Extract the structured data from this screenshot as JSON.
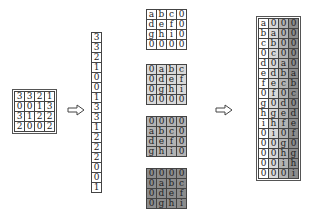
{
  "input_matrix": {
    "rows": [
      [
        "3",
        "3",
        "2",
        "1"
      ],
      [
        "0",
        "0",
        "1",
        "3"
      ],
      [
        "3",
        "1",
        "2",
        "2"
      ],
      [
        "2",
        "0",
        "0",
        "2"
      ]
    ]
  },
  "vectorized_input": {
    "values": [
      "3",
      "3",
      "2",
      "1",
      "0",
      "0",
      "1",
      "3",
      "3",
      "1",
      "2",
      "2",
      "2",
      "0",
      "0",
      "1"
    ]
  },
  "kernel_shifts": [
    {
      "shade": "#ffffff",
      "rows": [
        [
          "a",
          "b",
          "c",
          "0"
        ],
        [
          "d",
          "e",
          "f",
          "0"
        ],
        [
          "g",
          "h",
          "i",
          "0"
        ],
        [
          "0",
          "0",
          "0",
          "0"
        ]
      ]
    },
    {
      "shade": "#d9d9d9",
      "rows": [
        [
          "0",
          "a",
          "b",
          "c"
        ],
        [
          "0",
          "d",
          "e",
          "f"
        ],
        [
          "0",
          "g",
          "h",
          "i"
        ],
        [
          "0",
          "0",
          "0",
          "0"
        ]
      ]
    },
    {
      "shade": "#b3b3b3",
      "rows": [
        [
          "0",
          "0",
          "0",
          "0"
        ],
        [
          "a",
          "b",
          "c",
          "0"
        ],
        [
          "d",
          "e",
          "f",
          "0"
        ],
        [
          "g",
          "h",
          "i",
          "0"
        ]
      ]
    },
    {
      "shade": "#8c8c8c",
      "rows": [
        [
          "0",
          "0",
          "0",
          "0"
        ],
        [
          "0",
          "a",
          "b",
          "c"
        ],
        [
          "0",
          "d",
          "e",
          "f"
        ],
        [
          "0",
          "g",
          "h",
          "i"
        ]
      ]
    }
  ],
  "convolution_matrix": {
    "column_shades": [
      "#ffffff",
      "#d9d9d9",
      "#b3b3b3",
      "#8c8c8c"
    ],
    "rows": [
      [
        "a",
        "0",
        "0",
        "0"
      ],
      [
        "b",
        "a",
        "0",
        "0"
      ],
      [
        "c",
        "b",
        "0",
        "0"
      ],
      [
        "0",
        "c",
        "0",
        "0"
      ],
      [
        "d",
        "0",
        "a",
        "0"
      ],
      [
        "e",
        "d",
        "b",
        "a"
      ],
      [
        "f",
        "e",
        "c",
        "b"
      ],
      [
        "0",
        "f",
        "0",
        "c"
      ],
      [
        "g",
        "0",
        "d",
        "0"
      ],
      [
        "h",
        "g",
        "e",
        "d"
      ],
      [
        "i",
        "h",
        "f",
        "e"
      ],
      [
        "0",
        "i",
        "0",
        "f"
      ],
      [
        "0",
        "0",
        "g",
        "0"
      ],
      [
        "0",
        "0",
        "h",
        "g"
      ],
      [
        "0",
        "0",
        "i",
        "h"
      ],
      [
        "0",
        "0",
        "0",
        "i"
      ]
    ]
  },
  "arrows": [
    "right-arrow-1",
    "right-arrow-2"
  ]
}
